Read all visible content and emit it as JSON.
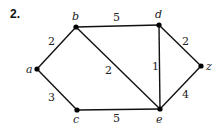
{
  "problem_number": "2.",
  "nodes": [
    {
      "id": "a",
      "label": "a",
      "x": 37,
      "y": 69,
      "lx": 26,
      "ly": 73
    },
    {
      "id": "b",
      "label": "b",
      "x": 76,
      "y": 27,
      "lx": 72,
      "ly": 20
    },
    {
      "id": "c",
      "label": "c",
      "x": 77,
      "y": 110,
      "lx": 73,
      "ly": 123
    },
    {
      "id": "d",
      "label": "d",
      "x": 159,
      "y": 25,
      "lx": 155,
      "ly": 18
    },
    {
      "id": "e",
      "label": "e",
      "x": 160,
      "y": 109,
      "lx": 156,
      "ly": 123
    },
    {
      "id": "z",
      "label": "z",
      "x": 201,
      "y": 66,
      "lx": 206,
      "ly": 70
    }
  ],
  "edges": [
    {
      "from": "a",
      "to": "b",
      "weight": "2",
      "lx": 48,
      "ly": 45
    },
    {
      "from": "a",
      "to": "c",
      "weight": "3",
      "lx": 48,
      "ly": 101
    },
    {
      "from": "b",
      "to": "d",
      "weight": "5",
      "lx": 113,
      "ly": 21
    },
    {
      "from": "b",
      "to": "e",
      "weight": "2",
      "lx": 105,
      "ly": 74
    },
    {
      "from": "c",
      "to": "e",
      "weight": "5",
      "lx": 113,
      "ly": 122
    },
    {
      "from": "d",
      "to": "e",
      "weight": "1",
      "lx": 152,
      "ly": 70
    },
    {
      "from": "d",
      "to": "z",
      "weight": "2",
      "lx": 182,
      "ly": 45
    },
    {
      "from": "e",
      "to": "z",
      "weight": "4",
      "lx": 182,
      "ly": 98
    }
  ]
}
